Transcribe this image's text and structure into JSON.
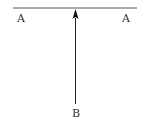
{
  "diagram": {
    "labels": {
      "left_end": "A",
      "right_end": "A",
      "bottom": "B"
    },
    "colors": {
      "line": "#555555",
      "arrow": "#111111",
      "text": "#333333"
    },
    "elements": {
      "horizontal_line": {
        "x1": 13,
        "y1": 8,
        "x2": 137,
        "y2": 8
      },
      "vertical_arrow": {
        "x": 75,
        "from_y": 104,
        "to_y": 9,
        "direction": "up"
      }
    }
  }
}
